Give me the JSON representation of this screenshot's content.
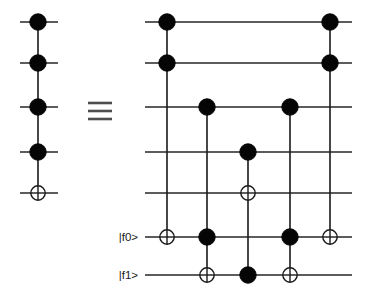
{
  "figure": {
    "equivalence_symbol": "≡",
    "background_color": "#ffffff",
    "ink_color": "#1a1a1a"
  },
  "labels": {
    "ancilla_0": "|f0>",
    "ancilla_1": "|f1>"
  },
  "chart_data": {
    "type": "diagram",
    "diagram_kind": "quantum-circuit",
    "rows": [
      {
        "id": "q1",
        "label": "",
        "y": 22
      },
      {
        "id": "q2",
        "label": "",
        "y": 63
      },
      {
        "id": "q3",
        "label": "",
        "y": 107
      },
      {
        "id": "q4",
        "label": "",
        "y": 152
      },
      {
        "id": "q5",
        "label": "",
        "y": 193
      },
      {
        "id": "f0",
        "label": "|f0>",
        "y": 237
      },
      {
        "id": "f1",
        "label": "|f1>",
        "y": 275
      }
    ],
    "left_circuit": {
      "name": "five-qubit-toffoli",
      "wire_x_start": 20,
      "wire_x_end": 58,
      "rows": [
        "q1",
        "q2",
        "q3",
        "q4",
        "q5"
      ],
      "columns": [
        {
          "x": 38,
          "controls": [
            "q1",
            "q2",
            "q3",
            "q4"
          ],
          "targets": [
            "q5"
          ]
        }
      ]
    },
    "right_circuit": {
      "name": "toffoli-decomposition-with-ancillas",
      "wire_x_start": 145,
      "wire_x_end": 352,
      "rows": [
        "q1",
        "q2",
        "q3",
        "q4",
        "q5",
        "f0",
        "f1"
      ],
      "columns": [
        {
          "x": 167,
          "controls": [
            "q1",
            "q2"
          ],
          "targets": [
            "f0"
          ]
        },
        {
          "x": 207,
          "controls": [
            "q3",
            "f0"
          ],
          "targets": [
            "f1"
          ]
        },
        {
          "x": 248,
          "controls": [
            "q4",
            "f1"
          ],
          "targets": [
            "q5"
          ]
        },
        {
          "x": 290,
          "controls": [
            "q3",
            "f0"
          ],
          "targets": [
            "f1"
          ]
        },
        {
          "x": 330,
          "controls": [
            "q1",
            "q2"
          ],
          "targets": [
            "f0"
          ]
        }
      ]
    },
    "equals_sign": {
      "x": 100,
      "y": 111,
      "glyph": "≡"
    }
  }
}
